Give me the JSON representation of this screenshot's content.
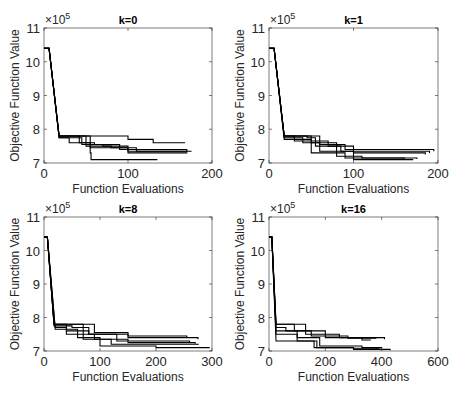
{
  "figure": {
    "layout": "2x2 subplots",
    "shared": {
      "xlabel": "Function Evaluations",
      "ylabel": "Objective Function Value",
      "y_multiplier": "×10",
      "y_multiplier_exp": "5",
      "ylim": [
        7,
        11
      ],
      "yticks": [
        "7",
        "8",
        "9",
        "10",
        "11"
      ]
    }
  },
  "chart_data": [
    {
      "type": "line",
      "title": "k=0",
      "xlabel": "Function Evaluations",
      "ylabel": "Objective Function Value",
      "y_scale": 100000,
      "xlim": [
        0,
        200
      ],
      "ylim": [
        7,
        11
      ],
      "xticks": [
        "0",
        "100",
        "200"
      ],
      "yticks": [
        "7",
        "8",
        "9",
        "10",
        "11"
      ],
      "grid": false,
      "initial_value": 10.4,
      "series": [
        {
          "name": "run1",
          "points": [
            [
              0,
              10.4
            ],
            [
              6,
              10.4
            ],
            [
              18,
              7.8
            ],
            [
              80,
              7.8
            ],
            [
              100,
              7.7
            ],
            [
              130,
              7.6
            ],
            [
              168,
              7.6
            ]
          ]
        },
        {
          "name": "run2",
          "points": [
            [
              0,
              10.4
            ],
            [
              6,
              10.4
            ],
            [
              18,
              7.8
            ],
            [
              45,
              7.8
            ],
            [
              55,
              7.3
            ],
            [
              56,
              7.1
            ],
            [
              135,
              7.1
            ]
          ]
        },
        {
          "name": "run3",
          "points": [
            [
              0,
              10.4
            ],
            [
              6,
              10.4
            ],
            [
              18,
              7.75
            ],
            [
              40,
              7.75
            ],
            [
              45,
              7.55
            ],
            [
              70,
              7.5
            ],
            [
              100,
              7.35
            ],
            [
              175,
              7.33
            ]
          ]
        },
        {
          "name": "run4",
          "points": [
            [
              0,
              10.4
            ],
            [
              6,
              10.4
            ],
            [
              18,
              7.8
            ],
            [
              38,
              7.8
            ],
            [
              42,
              7.6
            ],
            [
              60,
              7.55
            ],
            [
              90,
              7.4
            ],
            [
              170,
              7.35
            ]
          ]
        },
        {
          "name": "run5",
          "points": [
            [
              0,
              10.4
            ],
            [
              6,
              10.4
            ],
            [
              18,
              7.75
            ],
            [
              30,
              7.6
            ],
            [
              45,
              7.6
            ],
            [
              55,
              7.45
            ],
            [
              100,
              7.3
            ],
            [
              170,
              7.28
            ]
          ]
        },
        {
          "name": "run6",
          "points": [
            [
              0,
              10.4
            ],
            [
              6,
              10.4
            ],
            [
              18,
              7.8
            ],
            [
              44,
              7.8
            ],
            [
              50,
              7.5
            ],
            [
              80,
              7.45
            ],
            [
              110,
              7.35
            ],
            [
              170,
              7.32
            ]
          ]
        }
      ]
    },
    {
      "type": "line",
      "title": "k=1",
      "xlabel": "Function Evaluations",
      "ylabel": "Objective Function Value",
      "y_scale": 100000,
      "xlim": [
        0,
        200
      ],
      "ylim": [
        7,
        11
      ],
      "xticks": [
        "0",
        "100",
        "200"
      ],
      "yticks": [
        "7",
        "8",
        "9",
        "10",
        "11"
      ],
      "grid": false,
      "initial_value": 10.4,
      "series": [
        {
          "name": "run1",
          "points": [
            [
              0,
              10.4
            ],
            [
              6,
              10.4
            ],
            [
              18,
              7.8
            ],
            [
              48,
              7.8
            ],
            [
              60,
              7.55
            ],
            [
              90,
              7.4
            ],
            [
              195,
              7.35
            ]
          ]
        },
        {
          "name": "run2",
          "points": [
            [
              0,
              10.4
            ],
            [
              6,
              10.4
            ],
            [
              18,
              7.8
            ],
            [
              45,
              7.75
            ],
            [
              55,
              7.5
            ],
            [
              85,
              7.35
            ],
            [
              190,
              7.3
            ]
          ]
        },
        {
          "name": "run3",
          "points": [
            [
              0,
              10.4
            ],
            [
              6,
              10.4
            ],
            [
              18,
              7.7
            ],
            [
              35,
              7.7
            ],
            [
              50,
              7.3
            ],
            [
              90,
              7.15
            ],
            [
              175,
              7.12
            ]
          ]
        },
        {
          "name": "run4",
          "points": [
            [
              0,
              10.4
            ],
            [
              6,
              10.4
            ],
            [
              18,
              7.75
            ],
            [
              40,
              7.6
            ],
            [
              60,
              7.35
            ],
            [
              100,
              7.1
            ],
            [
              170,
              7.08
            ]
          ]
        },
        {
          "name": "run5",
          "points": [
            [
              0,
              10.4
            ],
            [
              6,
              10.4
            ],
            [
              18,
              7.8
            ],
            [
              30,
              7.65
            ],
            [
              70,
              7.5
            ],
            [
              100,
              7.3
            ],
            [
              185,
              7.25
            ]
          ]
        },
        {
          "name": "run6",
          "points": [
            [
              0,
              10.4
            ],
            [
              6,
              10.4
            ],
            [
              18,
              7.8
            ],
            [
              50,
              7.6
            ],
            [
              80,
              7.2
            ],
            [
              110,
              7.15
            ],
            [
              160,
              7.12
            ]
          ]
        }
      ]
    },
    {
      "type": "line",
      "title": "k=8",
      "xlabel": "Function Evaluations",
      "ylabel": "Objective Function Value",
      "y_scale": 100000,
      "xlim": [
        0,
        300
      ],
      "ylim": [
        7,
        11
      ],
      "xticks": [
        "0",
        "100",
        "200",
        "300"
      ],
      "yticks": [
        "7",
        "8",
        "9",
        "10",
        "11"
      ],
      "grid": false,
      "initial_value": 10.4,
      "series": [
        {
          "name": "run1",
          "points": [
            [
              0,
              10.4
            ],
            [
              6,
              10.4
            ],
            [
              18,
              7.8
            ],
            [
              60,
              7.8
            ],
            [
              90,
              7.55
            ],
            [
              150,
              7.45
            ],
            [
              255,
              7.42
            ]
          ]
        },
        {
          "name": "run2",
          "points": [
            [
              0,
              10.4
            ],
            [
              6,
              10.4
            ],
            [
              18,
              7.75
            ],
            [
              50,
              7.7
            ],
            [
              80,
              7.5
            ],
            [
              150,
              7.4
            ],
            [
              275,
              7.35
            ]
          ]
        },
        {
          "name": "run3",
          "points": [
            [
              0,
              10.4
            ],
            [
              6,
              10.4
            ],
            [
              20,
              7.7
            ],
            [
              40,
              7.5
            ],
            [
              90,
              7.35
            ],
            [
              150,
              7.25
            ],
            [
              270,
              7.22
            ]
          ]
        },
        {
          "name": "run4",
          "points": [
            [
              0,
              10.4
            ],
            [
              6,
              10.4
            ],
            [
              18,
              7.8
            ],
            [
              70,
              7.35
            ],
            [
              120,
              7.2
            ],
            [
              275,
              7.18
            ]
          ]
        },
        {
          "name": "run5",
          "points": [
            [
              0,
              10.4
            ],
            [
              6,
              10.4
            ],
            [
              20,
              7.65
            ],
            [
              60,
              7.4
            ],
            [
              100,
              7.15
            ],
            [
              200,
              7.1
            ],
            [
              295,
              7.08
            ]
          ]
        },
        {
          "name": "run6",
          "points": [
            [
              0,
              10.4
            ],
            [
              6,
              10.4
            ],
            [
              18,
              7.8
            ],
            [
              40,
              7.6
            ],
            [
              80,
              7.5
            ],
            [
              130,
              7.3
            ],
            [
              260,
              7.25
            ]
          ]
        }
      ]
    },
    {
      "type": "line",
      "title": "k=16",
      "xlabel": "Function Evaluations",
      "ylabel": "Objective Function Value",
      "y_scale": 100000,
      "xlim": [
        0,
        600
      ],
      "ylim": [
        7,
        11
      ],
      "xticks": [
        "0",
        "200",
        "400",
        "600"
      ],
      "yticks": [
        "7",
        "8",
        "9",
        "10",
        "11"
      ],
      "grid": false,
      "initial_value": 10.4,
      "series": [
        {
          "name": "run1",
          "points": [
            [
              0,
              10.4
            ],
            [
              10,
              10.4
            ],
            [
              25,
              7.8
            ],
            [
              80,
              7.8
            ],
            [
              130,
              7.5
            ],
            [
              250,
              7.4
            ],
            [
              410,
              7.35
            ]
          ]
        },
        {
          "name": "run2",
          "points": [
            [
              0,
              10.4
            ],
            [
              10,
              10.4
            ],
            [
              25,
              7.7
            ],
            [
              60,
              7.6
            ],
            [
              150,
              7.45
            ],
            [
              280,
              7.38
            ],
            [
              380,
              7.37
            ]
          ]
        },
        {
          "name": "run3",
          "points": [
            [
              0,
              10.4
            ],
            [
              10,
              10.4
            ],
            [
              25,
              7.5
            ],
            [
              100,
              7.3
            ],
            [
              160,
              7.1
            ],
            [
              300,
              7.05
            ],
            [
              430,
              7.02
            ]
          ]
        },
        {
          "name": "run4",
          "points": [
            [
              0,
              10.4
            ],
            [
              10,
              10.4
            ],
            [
              25,
              7.3
            ],
            [
              80,
              7.3
            ],
            [
              170,
              7.1
            ],
            [
              300,
              7.08
            ],
            [
              390,
              7.06
            ]
          ]
        },
        {
          "name": "run5",
          "points": [
            [
              0,
              10.4
            ],
            [
              10,
              10.4
            ],
            [
              25,
              7.6
            ],
            [
              100,
              7.4
            ],
            [
              180,
              7.15
            ],
            [
              330,
              7.1
            ],
            [
              400,
              7.08
            ]
          ]
        },
        {
          "name": "run6",
          "points": [
            [
              0,
              10.4
            ],
            [
              10,
              10.4
            ],
            [
              25,
              7.8
            ],
            [
              90,
              7.6
            ],
            [
              200,
              7.4
            ],
            [
              330,
              7.33
            ],
            [
              360,
              7.32
            ]
          ]
        }
      ]
    }
  ]
}
